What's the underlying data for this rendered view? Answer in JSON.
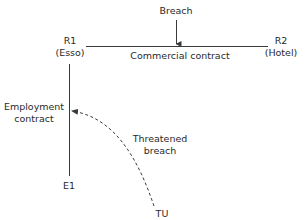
{
  "diagram": {
    "nodes": {
      "r1": {
        "line1": "R1",
        "line2": "(Esso)"
      },
      "r2": {
        "line1": "R2",
        "line2": "(Hotel)"
      },
      "e1": {
        "label": "E1"
      },
      "tu": {
        "label": "TU"
      }
    },
    "edges": {
      "commercial": {
        "label": "Commercial contract"
      },
      "employment": {
        "line1": "Employment",
        "line2": "contract"
      },
      "threatened": {
        "line1": "Threatened",
        "line2": "breach"
      }
    },
    "annotations": {
      "breach": {
        "label": "Breach"
      }
    },
    "colors": {
      "line": "#3a3a3a",
      "text": "#2a2a2a",
      "background": "#ffffff"
    }
  }
}
